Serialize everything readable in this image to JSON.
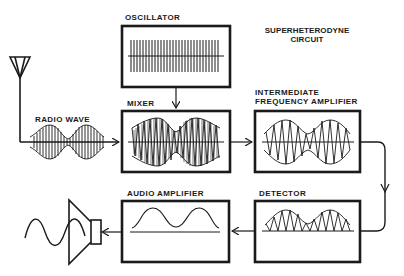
{
  "diagram": {
    "title_line1": "SUPERHETERODYNE",
    "title_line2": "CIRCUIT",
    "stages": {
      "oscillator": "OSCILLATOR",
      "radio_wave": "RADIO WAVE",
      "mixer": "MIXER",
      "if_amp_line1": "INTERMEDIATE",
      "if_amp_line2": "FREQUENCY AMPLIFIER",
      "detector": "DETECTOR",
      "audio_amp": "AUDIO AMPLIFIER"
    },
    "flow": [
      "Antenna",
      "Radio Wave",
      "Mixer",
      "Intermediate Frequency Amplifier",
      "Detector",
      "Audio Amplifier",
      "Speaker"
    ],
    "colors": {
      "ink": "#1a1a1a",
      "background": "#ffffff"
    }
  }
}
